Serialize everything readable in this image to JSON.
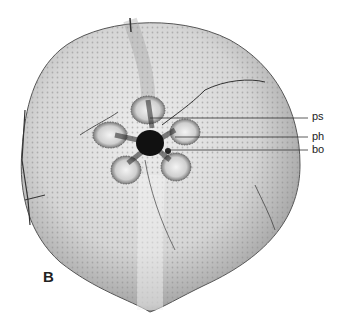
{
  "figure": {
    "panel_label": "B",
    "annotations": [
      {
        "label": "ps",
        "y": 117
      },
      {
        "label": "ph",
        "y": 137
      },
      {
        "label": "bo",
        "y": 150
      }
    ],
    "colors": {
      "background": "#ffffff",
      "test_light": "#e6e6e6",
      "test_mid": "#bdbdbd",
      "test_dark": "#6e6e6e",
      "peristome": "#111111",
      "leader_line": "#333333"
    }
  }
}
